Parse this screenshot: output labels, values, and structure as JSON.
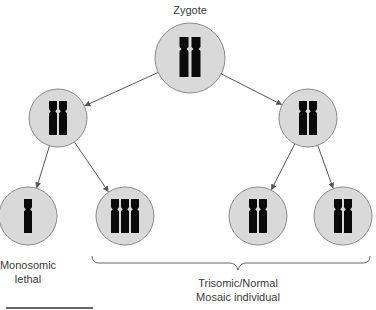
{
  "title": "Zygote",
  "colors": {
    "cell_fill": "#d9d9d9",
    "cell_stroke": "#8a8a8a",
    "chromosome": "#0a0a0a",
    "arrow": "#555555",
    "text": "#3a3a3a"
  },
  "cells": [
    {
      "id": "zygote",
      "level": 0,
      "chromosomes": 2
    },
    {
      "id": "daughter-left",
      "level": 1,
      "chromosomes": 2
    },
    {
      "id": "daughter-right",
      "level": 1,
      "chromosomes": 2
    },
    {
      "id": "monosomic-cell",
      "level": 2,
      "chromosomes": 1
    },
    {
      "id": "trisomic-cell",
      "level": 2,
      "chromosomes": 3
    },
    {
      "id": "normal-cell-1",
      "level": 2,
      "chromosomes": 2
    },
    {
      "id": "normal-cell-2",
      "level": 2,
      "chromosomes": 2
    }
  ],
  "edges": [
    [
      "zygote",
      "daughter-left"
    ],
    [
      "zygote",
      "daughter-right"
    ],
    [
      "daughter-left",
      "monosomic-cell"
    ],
    [
      "daughter-left",
      "trisomic-cell"
    ],
    [
      "daughter-right",
      "normal-cell-1"
    ],
    [
      "daughter-right",
      "normal-cell-2"
    ]
  ],
  "labels": {
    "monosomic_line1": "Monosomic",
    "monosomic_line2": "lethal",
    "mosaic_line1": "Trisomic/Normal",
    "mosaic_line2": "Mosaic individual"
  }
}
